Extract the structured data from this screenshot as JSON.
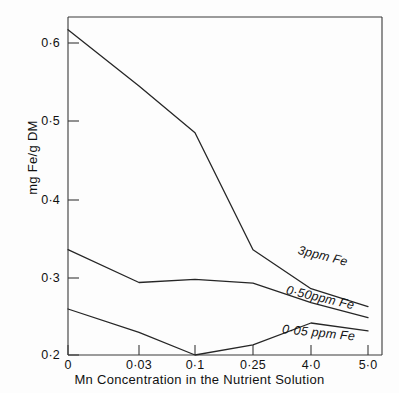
{
  "chart_data": {
    "type": "line",
    "title": "",
    "xlabel": "Mn Concentration in the Nutrient Solution",
    "ylabel": "mg Fe/g DM",
    "x_tick_labels": [
      "0",
      "0·03",
      "0·1",
      "0·25",
      "4·0",
      "5·0"
    ],
    "x_categories": [
      0,
      0.03,
      0.1,
      0.25,
      4.0,
      5.0
    ],
    "y_tick_labels": [
      "0·2",
      "0·3",
      "0·4",
      "0·5",
      "0·6"
    ],
    "y_ticks": [
      0.2,
      0.3,
      0.4,
      0.5,
      0.6
    ],
    "ylim": [
      0.175,
      0.64
    ],
    "grid": false,
    "legend_position": "inline-right",
    "series": [
      {
        "name": "3ppm Fe",
        "label": "3ppm Fe",
        "values": [
          0.617,
          0.545,
          0.485,
          0.335,
          0.285,
          0.262
        ]
      },
      {
        "name": "0·50ppm Fe",
        "label": "0·50ppm Fe",
        "values": [
          0.335,
          0.293,
          0.297,
          0.292,
          0.267,
          0.248
        ]
      },
      {
        "name": "0·05 ppm Fe",
        "label": "0·05 ppm Fe",
        "values": [
          0.259,
          0.229,
          0.2,
          0.213,
          0.241,
          0.231
        ]
      }
    ]
  },
  "axes": {
    "y_label_text": "mg Fe/g DM",
    "x_label_text": "Mn Concentration in the Nutrient Solution"
  },
  "style": {
    "line_color": "#262626",
    "axis_color": "#333333",
    "background": "#ffffff"
  }
}
